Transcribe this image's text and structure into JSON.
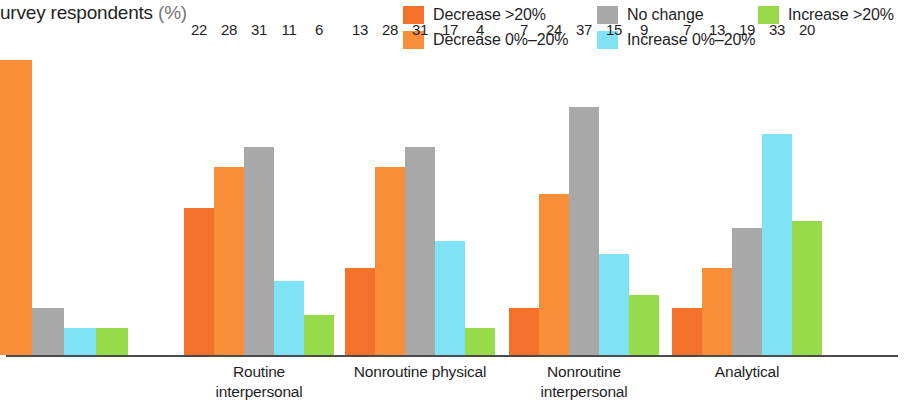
{
  "title": {
    "text": "urvey respondents",
    "unit": "(%)"
  },
  "legend": {
    "position": "top-right",
    "items": [
      {
        "label": "Decrease >20%",
        "color": "#F4712C",
        "key": "decrease_gt20",
        "row": 0,
        "col": 0
      },
      {
        "label": "Decrease 0%–20%",
        "color": "#F98E38",
        "key": "decrease_0_20",
        "row": 1,
        "col": 0
      },
      {
        "label": "No change",
        "color": "#A8A8A8",
        "key": "no_change",
        "row": 0,
        "col": 1
      },
      {
        "label": "Increase 0%–20%",
        "color": "#7FE3F5",
        "key": "increase_0_20",
        "row": 1,
        "col": 1
      },
      {
        "label": "Increase >20%",
        "color": "#97DB4B",
        "key": "increase_gt20",
        "row": 0,
        "col": 2
      }
    ]
  },
  "chart_data": {
    "type": "bar",
    "title": "urvey respondents (%)",
    "xlabel": "",
    "ylabel": "",
    "ylim": [
      0,
      45
    ],
    "grid": false,
    "legend_position": "top-right",
    "categories": [
      "Routine physical",
      "Routine interpersonal",
      "Nonroutine physical",
      "Nonroutine interpersonal",
      "Analytical"
    ],
    "category_lines": [
      [
        "Routine physical"
      ],
      [
        "Routine",
        "interpersonal"
      ],
      [
        "Nonroutine physical"
      ],
      [
        "Nonroutine",
        "interpersonal"
      ],
      [
        "Analytical"
      ]
    ],
    "series": [
      {
        "name": "Decrease >20%",
        "color": "#F4712C",
        "values": [
          41,
          22,
          13,
          7,
          7
        ]
      },
      {
        "name": "Decrease 0%–20%",
        "color": "#F98E38",
        "values": [
          44,
          28,
          28,
          24,
          13
        ]
      },
      {
        "name": "No change",
        "color": "#A8A8A8",
        "values": [
          7,
          31,
          31,
          37,
          19
        ]
      },
      {
        "name": "Increase 0%–20%",
        "color": "#7FE3F5",
        "values": [
          4,
          11,
          17,
          15,
          33
        ]
      },
      {
        "name": "Increase >20%",
        "color": "#97DB4B",
        "values": [
          4,
          6,
          4,
          9,
          20
        ]
      }
    ],
    "value_labels": [
      [
        "41",
        "",
        "7",
        "4",
        "4"
      ],
      [
        "22",
        "28",
        "31",
        "11",
        "6"
      ],
      [
        "13",
        "28",
        "31",
        "17",
        "4"
      ],
      [
        "7",
        "24",
        "37",
        "15",
        "9"
      ],
      [
        "7",
        "13",
        "19",
        "33",
        "20"
      ]
    ]
  },
  "groups": [
    {
      "label_lines": [
        "Routine physical"
      ],
      "left": -32,
      "width": 192,
      "bar_width": 32,
      "clipped_left": true,
      "bars": [
        {
          "series": 0,
          "value": 41,
          "label": "41",
          "color": "#F4712C",
          "show_label": true
        },
        {
          "series": 1,
          "value": 44,
          "label": "",
          "color": "#F98E38",
          "show_label": false
        },
        {
          "series": 2,
          "value": 7,
          "label": "7",
          "color": "#A8A8A8",
          "show_label": true
        },
        {
          "series": 3,
          "value": 4,
          "label": "4",
          "color": "#7FE3F5",
          "show_label": true
        },
        {
          "series": 4,
          "value": 4,
          "label": "4",
          "color": "#97DB4B",
          "show_label": true
        }
      ]
    },
    {
      "label_lines": [
        "Routine",
        "interpersonal"
      ],
      "left": 184,
      "width": 150,
      "bar_width": 30,
      "clipped_left": false,
      "bars": [
        {
          "series": 0,
          "value": 22,
          "label": "22",
          "color": "#F4712C",
          "show_label": true
        },
        {
          "series": 1,
          "value": 28,
          "label": "28",
          "color": "#F98E38",
          "show_label": true
        },
        {
          "series": 2,
          "value": 31,
          "label": "31",
          "color": "#A8A8A8",
          "show_label": true
        },
        {
          "series": 3,
          "value": 11,
          "label": "11",
          "color": "#7FE3F5",
          "show_label": true
        },
        {
          "series": 4,
          "value": 6,
          "label": "6",
          "color": "#97DB4B",
          "show_label": true
        }
      ]
    },
    {
      "label_lines": [
        "Nonroutine physical"
      ],
      "left": 345,
      "width": 150,
      "bar_width": 30,
      "clipped_left": false,
      "bars": [
        {
          "series": 0,
          "value": 13,
          "label": "13",
          "color": "#F4712C",
          "show_label": true
        },
        {
          "series": 1,
          "value": 28,
          "label": "28",
          "color": "#F98E38",
          "show_label": true
        },
        {
          "series": 2,
          "value": 31,
          "label": "31",
          "color": "#A8A8A8",
          "show_label": true
        },
        {
          "series": 3,
          "value": 17,
          "label": "17",
          "color": "#7FE3F5",
          "show_label": true
        },
        {
          "series": 4,
          "value": 4,
          "label": "4",
          "color": "#97DB4B",
          "show_label": true
        }
      ]
    },
    {
      "label_lines": [
        "Nonroutine",
        "interpersonal"
      ],
      "left": 509,
      "width": 150,
      "bar_width": 30,
      "clipped_left": false,
      "bars": [
        {
          "series": 0,
          "value": 7,
          "label": "7",
          "color": "#F4712C",
          "show_label": true
        },
        {
          "series": 1,
          "value": 24,
          "label": "24",
          "color": "#F98E38",
          "show_label": true
        },
        {
          "series": 2,
          "value": 37,
          "label": "37",
          "color": "#A8A8A8",
          "show_label": true
        },
        {
          "series": 3,
          "value": 15,
          "label": "15",
          "color": "#7FE3F5",
          "show_label": true
        },
        {
          "series": 4,
          "value": 9,
          "label": "9",
          "color": "#97DB4B",
          "show_label": true
        }
      ]
    },
    {
      "label_lines": [
        "Analytical"
      ],
      "left": 672,
      "width": 150,
      "bar_width": 30,
      "clipped_left": false,
      "bars": [
        {
          "series": 0,
          "value": 7,
          "label": "7",
          "color": "#F4712C",
          "show_label": true
        },
        {
          "series": 1,
          "value": 13,
          "label": "13",
          "color": "#F98E38",
          "show_label": true
        },
        {
          "series": 2,
          "value": 19,
          "label": "19",
          "color": "#A8A8A8",
          "show_label": true
        },
        {
          "series": 3,
          "value": 33,
          "label": "33",
          "color": "#7FE3F5",
          "show_label": true
        },
        {
          "series": 4,
          "value": 20,
          "label": "20",
          "color": "#97DB4B",
          "show_label": true
        }
      ]
    }
  ],
  "axis": {
    "baseline_color": "#4b4b4b"
  }
}
